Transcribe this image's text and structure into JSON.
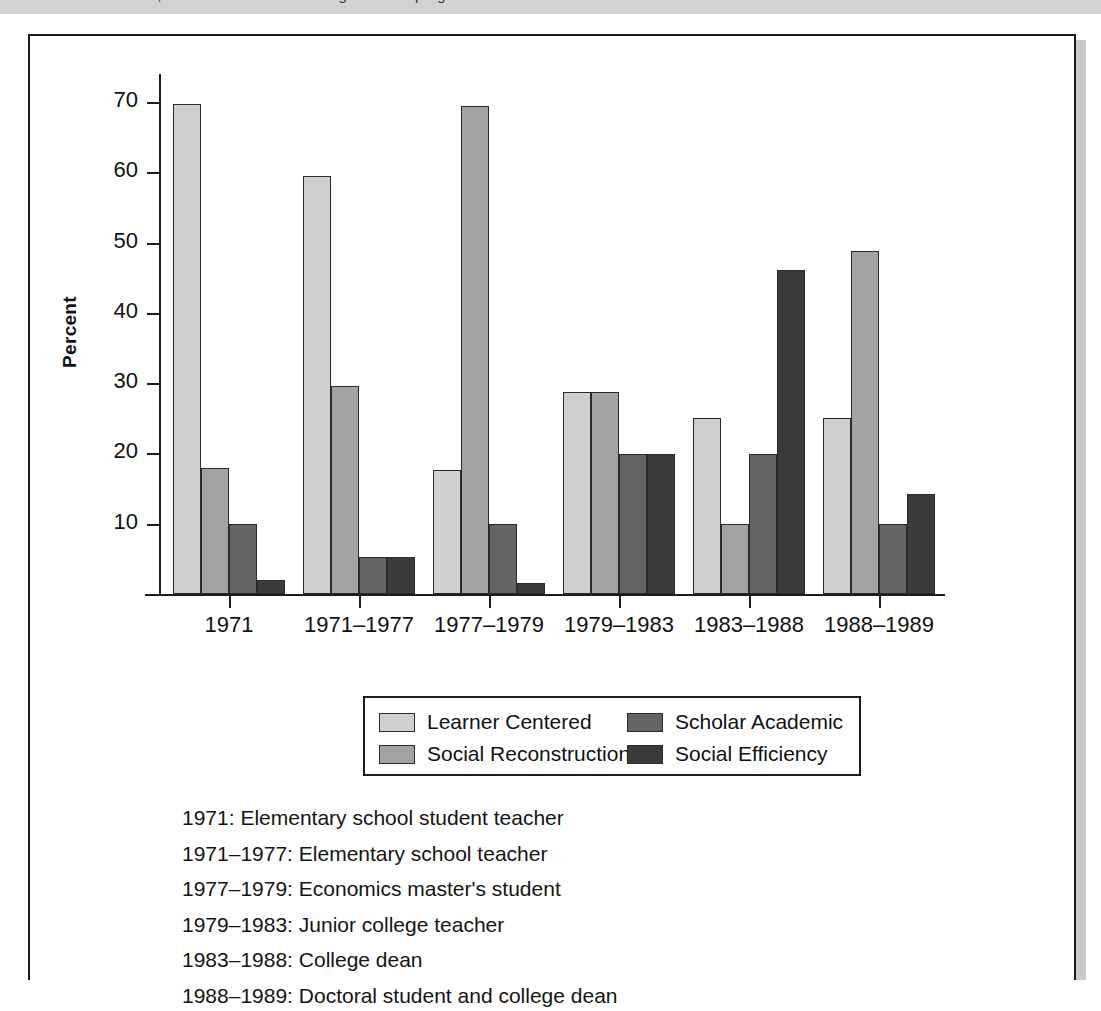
{
  "top_band": {
    "clipped_text": "of a teacher educator, and the curriculum ideologies of her program"
  },
  "axis": {
    "y_title": "Percent",
    "y_ticks": [
      10,
      20,
      30,
      40,
      50,
      60,
      70
    ],
    "y_min": 0,
    "y_max": 74
  },
  "legend": {
    "rows": [
      [
        {
          "label": "Learner Centered",
          "color": "#cfcfcf"
        },
        {
          "label": "Scholar Academic",
          "color": "#646464"
        }
      ],
      [
        {
          "label": "Social Reconstruction",
          "color": "#a3a3a3"
        },
        {
          "label": "Social Efficiency",
          "color": "#3b3b3b"
        }
      ]
    ]
  },
  "captions": [
    "1971: Elementary school student teacher",
    "1971–1977: Elementary school teacher",
    "1977–1979: Economics master's student",
    "1979–1983: Junior college teacher",
    "1983–1988: College dean",
    "1988–1989: Doctoral student and college dean"
  ],
  "chart_data": {
    "type": "bar",
    "title": "",
    "xlabel": "",
    "ylabel": "Percent",
    "ylim": [
      0,
      74
    ],
    "grid": false,
    "legend_position": "below-plot",
    "categories": [
      "1971",
      "1971–1977",
      "1977–1979",
      "1979–1983",
      "1983–1988",
      "1988–1989"
    ],
    "series": [
      {
        "name": "Learner Centered",
        "color": "#cfcfcf",
        "values": [
          69.8,
          59.5,
          17.7,
          28.7,
          25.0,
          25.0
        ]
      },
      {
        "name": "Social Reconstruction",
        "color": "#a3a3a3",
        "values": [
          18.0,
          29.6,
          69.5,
          28.7,
          10.0,
          48.8
        ]
      },
      {
        "name": "Scholar Academic",
        "color": "#646464",
        "values": [
          10.0,
          5.2,
          10.0,
          19.9,
          19.9,
          10.0
        ]
      },
      {
        "name": "Social Efficiency",
        "color": "#3b3b3b",
        "values": [
          2.0,
          5.2,
          1.6,
          19.9,
          46.1,
          14.2
        ]
      }
    ]
  }
}
